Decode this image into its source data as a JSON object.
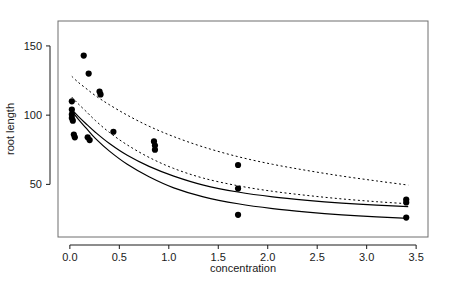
{
  "chart_data": {
    "type": "scatter",
    "title": "",
    "xlabel": "concentration",
    "ylabel": "root length",
    "xlim": [
      -0.12,
      3.62
    ],
    "ylim": [
      12,
      168
    ],
    "xticks": [
      0.0,
      0.5,
      1.0,
      1.5,
      2.0,
      2.5,
      3.0,
      3.5
    ],
    "xtick_labels": [
      "0.0",
      "0.5",
      "1.0",
      "1.5",
      "2.0",
      "2.5",
      "3.0",
      "3.5"
    ],
    "yticks": [
      50,
      100,
      150
    ],
    "ytick_labels": [
      "50",
      "100",
      "150"
    ],
    "grid": false,
    "legend": false,
    "frame": true,
    "points": [
      {
        "x": 0.02,
        "y": 110.0
      },
      {
        "x": 0.02,
        "y": 104.0
      },
      {
        "x": 0.02,
        "y": 100.5
      },
      {
        "x": 0.02,
        "y": 98.0
      },
      {
        "x": 0.03,
        "y": 96.0
      },
      {
        "x": 0.04,
        "y": 86.0
      },
      {
        "x": 0.05,
        "y": 84.0
      },
      {
        "x": 0.14,
        "y": 143.0
      },
      {
        "x": 0.19,
        "y": 130.0
      },
      {
        "x": 0.18,
        "y": 84.0
      },
      {
        "x": 0.2,
        "y": 82.0
      },
      {
        "x": 0.3,
        "y": 117.0
      },
      {
        "x": 0.31,
        "y": 115.0
      },
      {
        "x": 0.44,
        "y": 88.0
      },
      {
        "x": 0.85,
        "y": 81.0
      },
      {
        "x": 0.86,
        "y": 78.0
      },
      {
        "x": 0.86,
        "y": 75.0
      },
      {
        "x": 1.7,
        "y": 64.0
      },
      {
        "x": 1.7,
        "y": 47.0
      },
      {
        "x": 1.7,
        "y": 28.0
      },
      {
        "x": 3.4,
        "y": 39.0
      },
      {
        "x": 3.4,
        "y": 37.0
      },
      {
        "x": 3.4,
        "y": 26.0
      }
    ],
    "series": [
      {
        "name": "upper-confidence-band",
        "style": "dashed",
        "color": "#000000",
        "x": [
          0.02,
          0.08,
          0.16,
          0.26,
          0.4,
          0.58,
          0.8,
          1.05,
          1.35,
          1.7,
          2.05,
          2.4,
          2.75,
          3.1,
          3.42
        ],
        "y": [
          128.0,
          124.0,
          119.5,
          114.0,
          107.5,
          100.0,
          92.0,
          84.5,
          77.0,
          70.0,
          64.5,
          60.0,
          56.0,
          52.5,
          49.5
        ]
      },
      {
        "name": "upper-fit-curve",
        "style": "solid",
        "color": "#000000",
        "x": [
          0.02,
          0.08,
          0.16,
          0.26,
          0.4,
          0.58,
          0.8,
          1.05,
          1.35,
          1.7,
          2.05,
          2.4,
          2.75,
          3.1,
          3.42
        ],
        "y": [
          104.0,
          99.5,
          94.0,
          87.5,
          79.5,
          71.0,
          63.0,
          56.0,
          49.5,
          44.5,
          41.0,
          38.5,
          36.5,
          35.0,
          34.0
        ]
      },
      {
        "name": "lower-confidence-band",
        "style": "dashed",
        "color": "#000000",
        "x": [
          0.02,
          0.08,
          0.16,
          0.26,
          0.4,
          0.58,
          0.8,
          1.05,
          1.35,
          1.7,
          2.05,
          2.4,
          2.75,
          3.1,
          3.42
        ],
        "y": [
          113.0,
          108.5,
          103.0,
          96.0,
          87.5,
          78.5,
          69.5,
          61.5,
          54.5,
          49.0,
          45.0,
          42.0,
          39.5,
          37.5,
          36.0
        ]
      },
      {
        "name": "lower-fit-curve",
        "style": "solid",
        "color": "#000000",
        "x": [
          0.02,
          0.08,
          0.16,
          0.26,
          0.4,
          0.58,
          0.8,
          1.05,
          1.35,
          1.7,
          2.05,
          2.4,
          2.75,
          3.1,
          3.42
        ],
        "y": [
          103.0,
          97.5,
          91.0,
          83.0,
          74.0,
          64.5,
          55.5,
          47.5,
          41.0,
          36.0,
          32.5,
          30.0,
          28.0,
          26.5,
          25.5
        ]
      }
    ]
  }
}
